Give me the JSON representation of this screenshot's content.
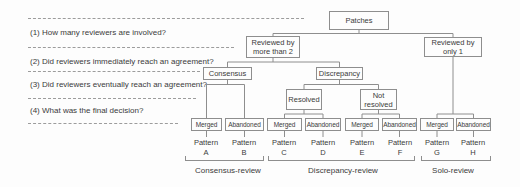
{
  "figure": {
    "questions": [
      "(1) How many reviewers are involved?",
      "(2) Did reviewers immediately reach an agreement?",
      "(3) Did reviewers eventually reach an agreement?",
      "(4) What was the final decision?"
    ],
    "nodes": {
      "patches": "Patches",
      "reviewed_multi": "Reviewed by more than 2",
      "reviewed_solo": "Reviewed by only 1",
      "consensus": "Consensus",
      "discrepancy": "Discrepancy",
      "resolved": "Resolved",
      "not_resolved": "Not resolved"
    },
    "outcomes": [
      {
        "label": "Merged",
        "pattern_word": "Pattern",
        "pattern_letter": "A"
      },
      {
        "label": "Abandoned",
        "pattern_word": "Pattern",
        "pattern_letter": "B"
      },
      {
        "label": "Merged",
        "pattern_word": "Pattern",
        "pattern_letter": "C"
      },
      {
        "label": "Abandoned",
        "pattern_word": "Pattern",
        "pattern_letter": "D"
      },
      {
        "label": "Merged",
        "pattern_word": "Pattern",
        "pattern_letter": "E"
      },
      {
        "label": "Abandoned",
        "pattern_word": "Pattern",
        "pattern_letter": "F"
      },
      {
        "label": "Merged",
        "pattern_word": "Pattern",
        "pattern_letter": "G"
      },
      {
        "label": "Abandoned",
        "pattern_word": "Pattern",
        "pattern_letter": "H"
      }
    ],
    "groups": [
      "Consensus-review",
      "Discrepancy-review",
      "Solo-review"
    ],
    "colors": {
      "line": "#8e8e8e",
      "text": "#3b3b3b",
      "background": "#fdfdfd"
    }
  }
}
